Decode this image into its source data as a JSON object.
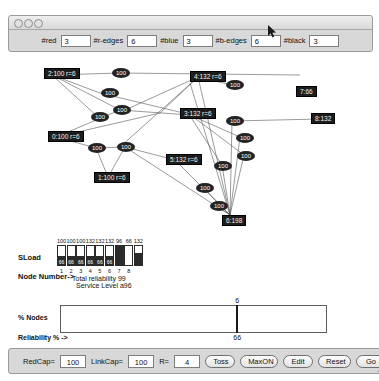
{
  "window": {
    "traffic_lights": [
      "close-dot",
      "minimize-dot",
      "zoom-dot"
    ],
    "params": [
      {
        "label": "#red",
        "value": "3"
      },
      {
        "label": "#r-edges",
        "value": "6"
      },
      {
        "label": "#blue",
        "value": "3"
      },
      {
        "label": "#b-edges",
        "value": "6"
      },
      {
        "label": "#black",
        "value": "3"
      }
    ]
  },
  "graph": {
    "nodes": [
      {
        "id": "n2",
        "label": "2:100 r=6",
        "x": 44,
        "y": 13
      },
      {
        "id": "n4",
        "label": "4:132 r=6",
        "x": 190,
        "y": 16
      },
      {
        "id": "n7",
        "label": "7:66",
        "x": 296,
        "y": 31
      },
      {
        "id": "n3",
        "label": "3:132 r=6",
        "x": 180,
        "y": 53
      },
      {
        "id": "n8",
        "label": "8:132",
        "x": 311,
        "y": 58
      },
      {
        "id": "n0",
        "label": "0:100 r=6",
        "x": 48,
        "y": 76
      },
      {
        "id": "n5",
        "label": "5:132 r=6",
        "x": 166,
        "y": 99
      },
      {
        "id": "n1",
        "label": "1:100 r=6",
        "x": 94,
        "y": 117
      },
      {
        "id": "n6",
        "label": "6:198",
        "x": 222,
        "y": 160
      }
    ],
    "edge_weight_nodes": [
      {
        "label": "100",
        "x": 112,
        "y": 13
      },
      {
        "label": "100",
        "x": 101,
        "y": 33
      },
      {
        "label": "100",
        "x": 113,
        "y": 50
      },
      {
        "label": "100",
        "x": 226,
        "y": 25
      },
      {
        "label": "100",
        "x": 91,
        "y": 57
      },
      {
        "label": "100",
        "x": 88,
        "y": 88
      },
      {
        "label": "100",
        "x": 117,
        "y": 87
      },
      {
        "label": "100",
        "x": 226,
        "y": 61
      },
      {
        "label": "100",
        "x": 236,
        "y": 78
      },
      {
        "label": "100",
        "x": 237,
        "y": 96
      },
      {
        "label": "100",
        "x": 214,
        "y": 106
      },
      {
        "label": "100",
        "x": 196,
        "y": 128
      },
      {
        "label": "100",
        "x": 210,
        "y": 146
      }
    ],
    "links": [
      [
        52,
        20,
        120,
        18
      ],
      [
        120,
        18,
        300,
        20
      ],
      [
        52,
        20,
        100,
        38
      ],
      [
        52,
        20,
        120,
        55
      ],
      [
        52,
        20,
        98,
        62
      ],
      [
        100,
        38,
        200,
        62
      ],
      [
        198,
        22,
        232,
        30
      ],
      [
        198,
        22,
        160,
        58
      ],
      [
        198,
        22,
        125,
        55
      ],
      [
        198,
        22,
        120,
        92
      ],
      [
        198,
        22,
        230,
        160
      ],
      [
        56,
        82,
        96,
        93
      ],
      [
        96,
        93,
        125,
        92
      ],
      [
        125,
        92,
        175,
        105
      ],
      [
        125,
        92,
        108,
        122
      ],
      [
        96,
        93,
        108,
        122
      ],
      [
        56,
        82,
        120,
        55
      ],
      [
        120,
        55,
        190,
        60
      ],
      [
        190,
        60,
        240,
        82
      ],
      [
        188,
        58,
        244,
        100
      ],
      [
        232,
        66,
        320,
        64
      ],
      [
        188,
        58,
        222,
        110
      ],
      [
        175,
        105,
        230,
        160
      ],
      [
        222,
        110,
        230,
        160
      ],
      [
        203,
        132,
        230,
        160
      ],
      [
        216,
        150,
        230,
        160
      ],
      [
        244,
        100,
        230,
        160
      ],
      [
        240,
        82,
        230,
        160
      ],
      [
        232,
        66,
        230,
        160
      ],
      [
        190,
        28,
        230,
        160
      ],
      [
        125,
        92,
        230,
        160
      ],
      [
        56,
        82,
        160,
        58
      ]
    ]
  },
  "sload_chart": {
    "sload_label": "SLoad",
    "node_number_label": "Node Number->",
    "total_reliability_line": "Total reliability 99",
    "service_level_line": "Service Level a96",
    "chart_data": {
      "type": "bar",
      "title": "SLoad",
      "xlabel": "Node Number->",
      "ylabel": "SLoad",
      "categories": [
        "1",
        "2",
        "3",
        "4",
        "5",
        "6",
        "7",
        "8"
      ],
      "top_labels": [
        "100",
        "100",
        "100",
        "132",
        "132",
        "132",
        "96",
        "66",
        "132"
      ],
      "values": [
        100,
        100,
        100,
        132,
        132,
        132,
        96,
        66,
        132
      ],
      "inner_labels": [
        "66",
        "66",
        "66",
        "66",
        "66",
        "66",
        "",
        "",
        ""
      ],
      "fill_fraction": [
        0.45,
        0.45,
        0.45,
        0.45,
        0.45,
        0.45,
        1.0,
        0.0,
        0.62
      ]
    }
  },
  "percent_nodes": {
    "title": "% Nodes",
    "axis_label": "Reliability % ->",
    "chart_data": {
      "type": "bar",
      "title": "% Nodes",
      "xlabel": "Reliability % ->",
      "ylabel": "% Nodes",
      "x": [
        66
      ],
      "values": [
        100
      ],
      "bar_top_label": "6",
      "bar_bottom_label": "66",
      "xlim": [
        0,
        100
      ],
      "grid": false
    }
  },
  "toolbar": {
    "redcap_label": "RedCap=",
    "redcap_value": "100",
    "linkcap_label": "LinkCap=",
    "linkcap_value": "100",
    "r_label": "R=",
    "r_value": "4",
    "buttons": [
      "Toss",
      "MaxON",
      "Edit",
      "Reset",
      "Go"
    ]
  },
  "colors": {
    "window_chrome": "#d8d8d8",
    "node_fill": "#1d1d1d",
    "node_text": "#f2f2f2",
    "bar_fill": "#2b2b2b",
    "canvas": "#ffffff"
  }
}
